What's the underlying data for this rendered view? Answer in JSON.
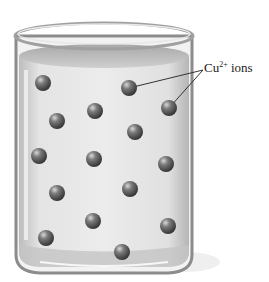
{
  "diagram": {
    "label": {
      "base": "Cu",
      "superscript": "2+",
      "suffix": " ions"
    },
    "colors": {
      "glass": "#9a9a9a",
      "solution": "#e2e2e2",
      "ion": "#5a5a5a",
      "text": "#222222"
    },
    "ions": [
      {
        "x": 43,
        "y": 83
      },
      {
        "x": 129,
        "y": 88
      },
      {
        "x": 95,
        "y": 111
      },
      {
        "x": 169,
        "y": 108
      },
      {
        "x": 57,
        "y": 121
      },
      {
        "x": 135,
        "y": 132
      },
      {
        "x": 39,
        "y": 156
      },
      {
        "x": 94,
        "y": 159
      },
      {
        "x": 166,
        "y": 164
      },
      {
        "x": 57,
        "y": 193
      },
      {
        "x": 130,
        "y": 189
      },
      {
        "x": 93,
        "y": 221
      },
      {
        "x": 168,
        "y": 226
      },
      {
        "x": 46,
        "y": 238
      },
      {
        "x": 122,
        "y": 252
      }
    ],
    "leader_lines": [
      {
        "from": [
          203,
          70
        ],
        "to": [
          129,
          88
        ]
      },
      {
        "from": [
          203,
          70
        ],
        "to": [
          169,
          108
        ]
      }
    ]
  }
}
